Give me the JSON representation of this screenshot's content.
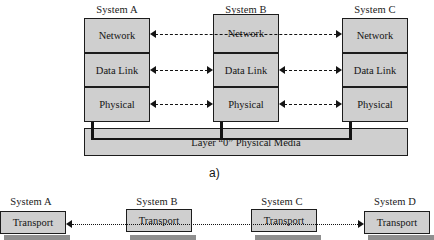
{
  "figure": {
    "caption_a": "a)",
    "media_label": "Layer “0” Physical Media"
  },
  "part_a": {
    "systems": [
      {
        "id": "a",
        "title": "System A",
        "layers": [
          "Network",
          "Data Link",
          "Physical"
        ]
      },
      {
        "id": "b",
        "title": "System B",
        "layers": [
          "Network",
          "Data Link",
          "Physical"
        ]
      },
      {
        "id": "c",
        "title": "System C",
        "layers": [
          "Network",
          "Data Link",
          "Physical"
        ]
      }
    ],
    "peer_links": [
      {
        "layer": "Network",
        "from": "System A",
        "to": "System C",
        "style": "dashed",
        "heads": "both",
        "spans_through": "System B"
      },
      {
        "layer": "Data Link",
        "from": "System A",
        "to": "System B",
        "style": "dashed",
        "heads": "both"
      },
      {
        "layer": "Data Link",
        "from": "System B",
        "to": "System C",
        "style": "dashed",
        "heads": "both"
      },
      {
        "layer": "Physical",
        "from": "System A",
        "to": "System B",
        "style": "dashed",
        "heads": "both"
      },
      {
        "layer": "Physical",
        "from": "System B",
        "to": "System C",
        "style": "dashed",
        "heads": "both"
      }
    ]
  },
  "part_b": {
    "systems": [
      {
        "id": "a",
        "title": "System A",
        "layer": "Transport"
      },
      {
        "id": "b",
        "title": "System B",
        "layer": "Transport"
      },
      {
        "id": "c",
        "title": "System C",
        "layer": "Transport"
      },
      {
        "id": "d",
        "title": "System D",
        "layer": "Transport"
      }
    ],
    "peer_links": [
      {
        "layer": "Transport",
        "from": "System D",
        "to": "System A",
        "style": "dotted",
        "heads": "both"
      }
    ]
  },
  "colors": {
    "box_fill": "#cfcfcf",
    "stroke": "#141414",
    "page_background": "#ffffff",
    "shadow": "#8f8f8f"
  }
}
